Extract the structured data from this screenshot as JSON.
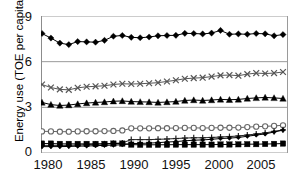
{
  "chart_data": {
    "type": "line",
    "title": "",
    "xlabel": "",
    "ylabel": "Energy use (TOE per capita)",
    "xlim": [
      1980,
      2007
    ],
    "ylim": [
      0,
      9
    ],
    "yticks": [
      "0",
      "3",
      "6",
      "9"
    ],
    "ytick_values": [
      0,
      3,
      6,
      9
    ],
    "xticks": [
      "1980",
      "1985",
      "1990",
      "1995",
      "2000",
      "2005"
    ],
    "xtick_values": [
      1980,
      1985,
      1990,
      1995,
      2000,
      2005
    ],
    "grid": "horizontal",
    "legend": "none",
    "x": [
      1980,
      1981,
      1982,
      1983,
      1984,
      1985,
      1986,
      1987,
      1988,
      1989,
      1990,
      1991,
      1992,
      1993,
      1994,
      1995,
      1996,
      1997,
      1998,
      1999,
      2000,
      2001,
      2002,
      2003,
      2004,
      2005,
      2006,
      2007
    ],
    "series": [
      {
        "name": "series-diamond",
        "marker": "filled-diamond",
        "color": "#000000",
        "values": [
          7.85,
          7.55,
          7.22,
          7.12,
          7.32,
          7.3,
          7.28,
          7.4,
          7.67,
          7.72,
          7.6,
          7.57,
          7.62,
          7.7,
          7.72,
          7.73,
          7.86,
          7.85,
          7.82,
          7.88,
          8.05,
          7.8,
          7.82,
          7.8,
          7.85,
          7.83,
          7.7,
          7.78
        ]
      },
      {
        "name": "series-cross-x",
        "marker": "x-mark",
        "color": "#555555",
        "values": [
          4.5,
          4.3,
          4.18,
          4.15,
          4.28,
          4.35,
          4.38,
          4.42,
          4.5,
          4.55,
          4.53,
          4.55,
          4.58,
          4.62,
          4.7,
          4.78,
          4.88,
          4.92,
          4.95,
          5.02,
          5.1,
          5.12,
          5.08,
          5.18,
          5.25,
          5.22,
          5.25,
          5.32
        ]
      },
      {
        "name": "series-triangle",
        "marker": "filled-triangle",
        "color": "#000000",
        "values": [
          3.32,
          3.18,
          3.12,
          3.15,
          3.22,
          3.28,
          3.32,
          3.35,
          3.4,
          3.42,
          3.38,
          3.36,
          3.35,
          3.32,
          3.35,
          3.38,
          3.45,
          3.48,
          3.45,
          3.48,
          3.52,
          3.5,
          3.52,
          3.58,
          3.62,
          3.65,
          3.62,
          3.58
        ]
      },
      {
        "name": "series-open-circle",
        "marker": "open-circle",
        "color": "#666666",
        "values": [
          1.42,
          1.42,
          1.4,
          1.4,
          1.42,
          1.43,
          1.43,
          1.44,
          1.45,
          1.48,
          1.62,
          1.62,
          1.62,
          1.63,
          1.63,
          1.64,
          1.65,
          1.65,
          1.64,
          1.65,
          1.66,
          1.66,
          1.67,
          1.7,
          1.73,
          1.75,
          1.78,
          1.82
        ]
      },
      {
        "name": "series-plus",
        "marker": "plus-mark",
        "color": "#222222",
        "values": [
          0.5,
          0.5,
          0.5,
          0.5,
          0.52,
          0.55,
          0.58,
          0.6,
          0.63,
          0.66,
          0.88,
          0.88,
          0.88,
          0.9,
          0.92,
          0.95,
          0.98,
          1.0,
          1.0,
          1.02,
          1.05,
          1.08,
          1.12,
          1.18,
          1.25,
          1.32,
          1.42,
          1.52
        ]
      },
      {
        "name": "series-filled-square",
        "marker": "filled-square",
        "color": "#000000",
        "values": [
          0.62,
          0.62,
          0.6,
          0.6,
          0.6,
          0.6,
          0.6,
          0.6,
          0.62,
          0.62,
          0.55,
          0.54,
          0.54,
          0.54,
          0.54,
          0.55,
          0.55,
          0.55,
          0.55,
          0.55,
          0.56,
          0.56,
          0.57,
          0.58,
          0.58,
          0.59,
          0.6,
          0.62
        ]
      },
      {
        "name": "series-small-diamond-low",
        "marker": "filled-diamond-small",
        "color": "#000000",
        "values": [
          0.42,
          0.42,
          0.42,
          0.43,
          0.45,
          0.46,
          0.48,
          0.5,
          0.52,
          0.54,
          0.62,
          0.63,
          0.65,
          0.68,
          0.72,
          0.75,
          0.8,
          0.84,
          0.86,
          0.9,
          0.95,
          0.98,
          1.02,
          1.1,
          1.18,
          1.25,
          1.38,
          1.5
        ]
      }
    ],
    "colors": {
      "axis": "#8c8c8c",
      "grid": "#9a9a9a",
      "text": "#111111",
      "plot_background": "#ffffff"
    }
  }
}
